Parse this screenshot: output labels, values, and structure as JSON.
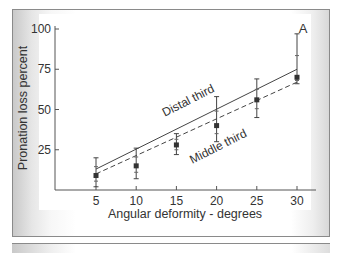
{
  "chart_data": {
    "type": "line",
    "title": "",
    "panel_label": "A",
    "xlabel": "Angular deformity - degrees",
    "ylabel": "Pronation loss percent",
    "x": [
      5,
      10,
      15,
      20,
      25,
      30
    ],
    "xticks": [
      "5",
      "10",
      "15",
      "20",
      "25",
      "30"
    ],
    "yticks": [
      "25",
      "50",
      "75",
      "100"
    ],
    "xlim": [
      0,
      32
    ],
    "ylim": [
      0,
      100
    ],
    "grid": false,
    "points": {
      "name": "Mean pronation loss",
      "values": [
        9,
        15,
        28,
        40,
        56,
        70
      ],
      "error_low": [
        2,
        7,
        22,
        30,
        45,
        66
      ],
      "error_high": [
        20,
        26,
        35,
        58,
        69,
        97
      ]
    },
    "series": [
      {
        "name": "Distal third",
        "style": "solid",
        "x": [
          5,
          30
        ],
        "values": [
          13,
          75
        ]
      },
      {
        "name": "Middle third",
        "style": "dashed",
        "x": [
          5,
          30
        ],
        "values": [
          10,
          67
        ]
      }
    ],
    "annotations": [
      "Distal third",
      "Middle third",
      "A"
    ]
  }
}
